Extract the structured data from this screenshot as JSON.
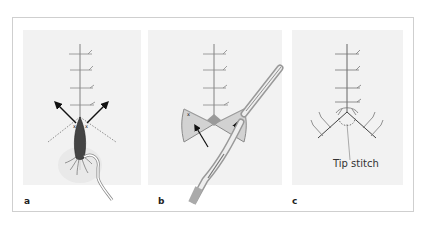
{
  "figure": {
    "panels": [
      {
        "id": "a",
        "label": "a",
        "description": "Suture line with arrows indicating flap movement and dotted incision lines; needle holder with suture below"
      },
      {
        "id": "b",
        "label": "b",
        "description": "Bow-tie shaped triangular flaps with arrows showing rotation; forceps and needle holder"
      },
      {
        "id": "c",
        "label": "c",
        "description": "Completed Y-shaped closure with dashed tip stitch",
        "annotation": "Tip stitch"
      }
    ]
  },
  "colors": {
    "frame": "#cfcfcf",
    "panel_background": "#f2f2f2",
    "line": "#555555",
    "arrow": "#111111",
    "flap": "#d0d0d0",
    "flap_edge": "#888888"
  }
}
